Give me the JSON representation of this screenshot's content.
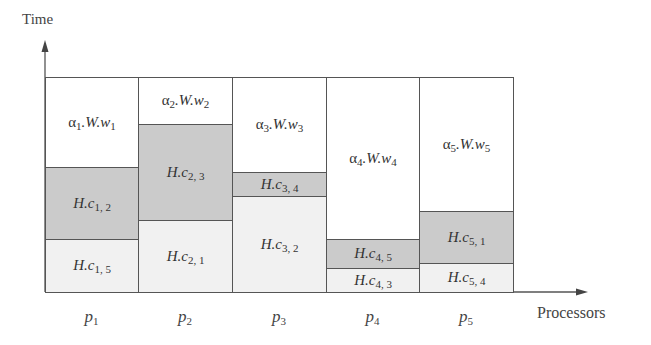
{
  "diagram": {
    "y_axis_label": "Time",
    "x_axis_label": "Processors",
    "colors": {
      "work": "#ffffff",
      "communication_dark": "#cbcbcb",
      "communication_light": "#f1f1f1",
      "border": "#555555"
    },
    "processors": [
      {
        "name": "p",
        "index": "1",
        "blocks": [
          {
            "type": "work",
            "prefix": "α",
            "sub": "1",
            "rest": ".W.w",
            "rest_sub": "1",
            "top": 77,
            "bottom": 167
          },
          {
            "type": "dark",
            "prefix": "H.c",
            "sub": "1, 2",
            "top": 167,
            "bottom": 239
          },
          {
            "type": "light",
            "prefix": "H.c",
            "sub": "1, 5",
            "top": 239,
            "bottom": 292
          }
        ]
      },
      {
        "name": "p",
        "index": "2",
        "blocks": [
          {
            "type": "work",
            "prefix": "α",
            "sub": "2",
            "rest": ".W.w",
            "rest_sub": "2",
            "top": 77,
            "bottom": 124
          },
          {
            "type": "dark",
            "prefix": "H.c",
            "sub": "2, 3",
            "top": 124,
            "bottom": 220
          },
          {
            "type": "light",
            "prefix": "H.c",
            "sub": "2, 1",
            "top": 220,
            "bottom": 292
          }
        ]
      },
      {
        "name": "p",
        "index": "3",
        "blocks": [
          {
            "type": "work",
            "prefix": "α",
            "sub": "3",
            "rest": ".W.w",
            "rest_sub": "3",
            "top": 77,
            "bottom": 172
          },
          {
            "type": "dark",
            "prefix": "H.c",
            "sub": "3, 4",
            "top": 172,
            "bottom": 196
          },
          {
            "type": "light",
            "prefix": "H.c",
            "sub": "3, 2",
            "top": 196,
            "bottom": 292
          }
        ]
      },
      {
        "name": "p",
        "index": "4",
        "blocks": [
          {
            "type": "work",
            "prefix": "α",
            "sub": "4",
            "rest": ".W.w",
            "rest_sub": "4",
            "top": 77,
            "bottom": 239
          },
          {
            "type": "dark",
            "prefix": "H.c",
            "sub": "4, 5",
            "top": 239,
            "bottom": 268
          },
          {
            "type": "light",
            "prefix": "H.c",
            "sub": "4, 3",
            "top": 268,
            "bottom": 292
          }
        ]
      },
      {
        "name": "p",
        "index": "5",
        "blocks": [
          {
            "type": "work",
            "prefix": "α",
            "sub": "5",
            "rest": ".W.w",
            "rest_sub": "5",
            "top": 77,
            "bottom": 211
          },
          {
            "type": "dark",
            "prefix": "H.c",
            "sub": "5, 1",
            "top": 211,
            "bottom": 263
          },
          {
            "type": "light",
            "prefix": "H.c",
            "sub": "5, 4",
            "top": 263,
            "bottom": 292
          }
        ]
      }
    ]
  }
}
